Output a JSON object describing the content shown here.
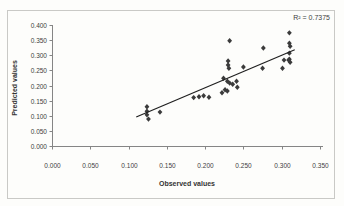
{
  "chart_data": {
    "type": "scatter",
    "title": "",
    "xlabel": "Observed values",
    "ylabel": "Predicted values",
    "annotation": "R² = 0.7375",
    "r_squared": 0.7375,
    "xlim": [
      0.0,
      0.35
    ],
    "ylim": [
      0.0,
      0.4
    ],
    "x_tick_labels": [
      "0.000",
      "0.050",
      "0.100",
      "0.150",
      "0.200",
      "0.250",
      "0.300",
      "0.350"
    ],
    "y_tick_labels": [
      "0.000",
      "0.050",
      "0.100",
      "0.150",
      "0.200",
      "0.250",
      "0.300",
      "0.350",
      "0.400"
    ],
    "grid": false,
    "legend": "none",
    "marker": "diamond",
    "points": [
      [
        0.124,
        0.13
      ],
      [
        0.124,
        0.115
      ],
      [
        0.124,
        0.103
      ],
      [
        0.126,
        0.089
      ],
      [
        0.141,
        0.112
      ],
      [
        0.185,
        0.16
      ],
      [
        0.192,
        0.163
      ],
      [
        0.198,
        0.166
      ],
      [
        0.205,
        0.161
      ],
      [
        0.222,
        0.176
      ],
      [
        0.226,
        0.186
      ],
      [
        0.229,
        0.182
      ],
      [
        0.224,
        0.224
      ],
      [
        0.229,
        0.214
      ],
      [
        0.232,
        0.208
      ],
      [
        0.236,
        0.204
      ],
      [
        0.241,
        0.214
      ],
      [
        0.242,
        0.194
      ],
      [
        0.23,
        0.281
      ],
      [
        0.23,
        0.268
      ],
      [
        0.231,
        0.257
      ],
      [
        0.232,
        0.348
      ],
      [
        0.25,
        0.261
      ],
      [
        0.276,
        0.324
      ],
      [
        0.275,
        0.257
      ],
      [
        0.301,
        0.257
      ],
      [
        0.303,
        0.284
      ],
      [
        0.309,
        0.284
      ],
      [
        0.31,
        0.374
      ],
      [
        0.31,
        0.34
      ],
      [
        0.311,
        0.33
      ],
      [
        0.31,
        0.307
      ],
      [
        0.31,
        0.287
      ],
      [
        0.311,
        0.277
      ]
    ],
    "trendline": {
      "x1": 0.11,
      "y1": 0.096,
      "x2": 0.317,
      "y2": 0.318
    },
    "colors": {
      "marker": "#3b3b3b",
      "trendline": "#1f1f1f",
      "axis": "#858585",
      "tick_text": "#3e3e3e",
      "frame_border": "#c9c9c6",
      "background": "#fdfdfb"
    }
  }
}
